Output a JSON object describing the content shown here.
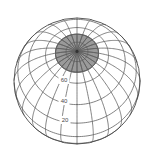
{
  "figure": {
    "type": "globe-graticule",
    "projection": "orthographic",
    "background_color": "#ffffff",
    "line_color": "#585858",
    "cap_fill_color": "#9a9a9a",
    "label_color": "#4a4a4a",
    "pole_marker": "center-dot"
  },
  "chart_data": {
    "type": "scatter",
    "title": "",
    "xlabel": "",
    "ylabel": "",
    "projection": "orthographic globe graticule",
    "view": {
      "center_longitude": 0,
      "center_latitude": 62,
      "radius_px": 63,
      "center_x_px": 77,
      "center_y_px": 81
    },
    "graticule": {
      "meridian_step_deg": 15,
      "meridian_count": 24,
      "parallel_step_deg": 20,
      "parallels_deg": [
        0,
        20,
        40,
        60,
        80
      ],
      "grid": true
    },
    "polar_cap": {
      "shaded": true,
      "boundary_latitude_deg": 70,
      "fill": "#9a9a9a",
      "spoke_count": 24
    },
    "tick_labels": [
      {
        "text": "60",
        "latitude_deg": 60,
        "x_px": 64,
        "y_px": 80
      },
      {
        "text": "40",
        "latitude_deg": 40,
        "x_px": 64,
        "y_px": 101
      },
      {
        "text": "20",
        "latitude_deg": 20,
        "x_px": 65,
        "y_px": 120
      }
    ],
    "legend": [],
    "annotations": []
  },
  "labels": {
    "lat_60": "60",
    "lat_40": "40",
    "lat_20": "20"
  }
}
